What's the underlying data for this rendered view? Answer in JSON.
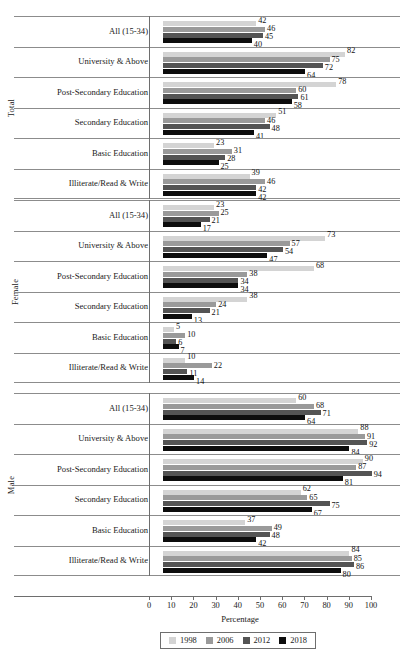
{
  "chart_data": {
    "type": "bar",
    "orientation": "horizontal",
    "title": "",
    "xlabel": "Percentage",
    "ylabel": "",
    "xlim": [
      0,
      100
    ],
    "xticks": [
      0,
      10,
      20,
      30,
      40,
      50,
      60,
      70,
      80,
      90,
      100
    ],
    "grid": false,
    "legend_position": "bottom",
    "series": [
      {
        "name": "1998",
        "color": "#d4d4d4"
      },
      {
        "name": "2006",
        "color": "#9a9a9a"
      },
      {
        "name": "2012",
        "color": "#545454"
      },
      {
        "name": "2018",
        "color": "#0d0d0d"
      }
    ],
    "categories": [
      "All (15-34)",
      "University & Above",
      "Post-Secondary Education",
      "Secondary Education",
      "Basic Education",
      "Illiterate/Read & Write"
    ],
    "panels": [
      {
        "name": "Total",
        "rows": [
          {
            "category": "All (15-34)",
            "values": [
              42,
              46,
              45,
              40
            ]
          },
          {
            "category": "University & Above",
            "values": [
              82,
              75,
              72,
              64
            ]
          },
          {
            "category": "Post-Secondary Education",
            "values": [
              78,
              60,
              61,
              58
            ]
          },
          {
            "category": "Secondary Education",
            "values": [
              51,
              46,
              48,
              41
            ]
          },
          {
            "category": "Basic Education",
            "values": [
              23,
              31,
              28,
              25
            ]
          },
          {
            "category": "Illiterate/Read & Write",
            "values": [
              39,
              46,
              42,
              42
            ]
          }
        ]
      },
      {
        "name": "Female",
        "rows": [
          {
            "category": "All (15-34)",
            "values": [
              23,
              25,
              21,
              17
            ]
          },
          {
            "category": "University & Above",
            "values": [
              73,
              57,
              54,
              47
            ]
          },
          {
            "category": "Post-Secondary Education",
            "values": [
              68,
              38,
              34,
              34
            ]
          },
          {
            "category": "Secondary Education",
            "values": [
              38,
              24,
              21,
              13
            ]
          },
          {
            "category": "Basic Education",
            "values": [
              5,
              10,
              6,
              7
            ]
          },
          {
            "category": "Illiterate/Read & Write",
            "values": [
              10,
              22,
              11,
              14
            ]
          }
        ]
      },
      {
        "name": "Male",
        "rows": [
          {
            "category": "All (15-34)",
            "values": [
              60,
              68,
              71,
              64
            ]
          },
          {
            "category": "University & Above",
            "values": [
              88,
              91,
              92,
              84
            ]
          },
          {
            "category": "Post-Secondary Education",
            "values": [
              90,
              87,
              94,
              81
            ]
          },
          {
            "category": "Secondary Education",
            "values": [
              62,
              65,
              75,
              67
            ]
          },
          {
            "category": "Basic Education",
            "values": [
              37,
              49,
              48,
              42
            ]
          },
          {
            "category": "Illiterate/Read & Write",
            "values": [
              84,
              85,
              86,
              80
            ]
          }
        ]
      }
    ]
  }
}
